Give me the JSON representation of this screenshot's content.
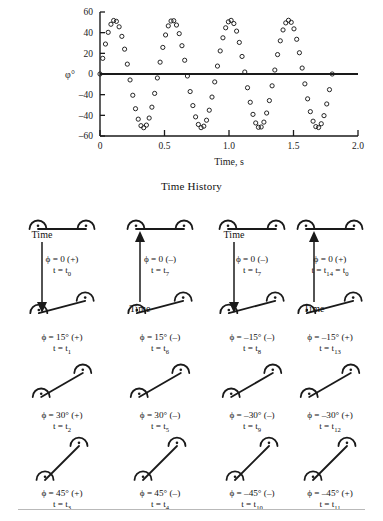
{
  "chart_data": {
    "type": "scatter",
    "title": "",
    "xlabel": "Time, s",
    "ylabel": "φ°",
    "xlim": [
      0,
      2.0
    ],
    "ylim": [
      -60,
      60
    ],
    "xticks": [
      "0",
      "0.5",
      "1.0",
      "1.5",
      "2.0"
    ],
    "xtick_values": [
      0,
      0.5,
      1.0,
      1.5,
      2.0
    ],
    "yticks": [
      "60",
      "40",
      "20",
      "0",
      "–40",
      "–40",
      "–60"
    ],
    "ytick_values": [
      60,
      40,
      20,
      0,
      -20,
      -40,
      -60
    ],
    "grid": false,
    "legend": null,
    "marker": "open-circle",
    "amplitude": 52,
    "period": 0.45,
    "phase": 0.08,
    "n_points": 86,
    "x_data_max": 1.8,
    "series": [
      {
        "name": "roll angle",
        "marker": "open-circle",
        "color": "#1a1a1a"
      }
    ]
  },
  "caption": {
    "time_history": "Time History"
  },
  "arrows": [
    {
      "name": "time-arrow-1",
      "label": "Time",
      "direction": "down",
      "label_position": "top"
    },
    {
      "name": "time-arrow-2",
      "label": "Time",
      "direction": "up",
      "label_position": "bottom"
    },
    {
      "name": "time-arrow-3",
      "label": "Time",
      "direction": "down",
      "label_position": "top"
    },
    {
      "name": "time-arrow-4",
      "label": "Time",
      "direction": "up",
      "label_position": "bottom"
    }
  ],
  "cells": [
    {
      "angle": 0,
      "phi": "ϕ = 0 (+)",
      "t": "t = t",
      "sub": "0",
      "shape": "flat",
      "mirror": false
    },
    {
      "angle": 0,
      "phi": "ϕ = 0 (–)",
      "t": "t = t",
      "sub": "7",
      "shape": "flat",
      "mirror": false
    },
    {
      "angle": 0,
      "phi": "ϕ = 0 (–)",
      "t": "t = t",
      "sub": "7",
      "shape": "flat",
      "mirror": true
    },
    {
      "angle": 0,
      "phi": "ϕ = 0 (+)",
      "t": "t = t",
      "sub": "14",
      "sub2": "0",
      "t2": " = t",
      "shape": "flat",
      "mirror": true
    },
    {
      "angle": 15,
      "phi": "ϕ = 15° (+)",
      "t": "t = t",
      "sub": "1",
      "shape": "tilt15",
      "mirror": false
    },
    {
      "angle": 15,
      "phi": "ϕ = 15° (–)",
      "t": "t = t",
      "sub": "6",
      "shape": "tilt15",
      "mirror": false
    },
    {
      "angle": -15,
      "phi": "ϕ = –15° (–)",
      "t": "t = t",
      "sub": "8",
      "shape": "tilt15",
      "mirror": true
    },
    {
      "angle": -15,
      "phi": "ϕ = –15° (+)",
      "t": "t = t",
      "sub": "13",
      "shape": "tilt15",
      "mirror": true
    },
    {
      "angle": 30,
      "phi": "ϕ = 30° (+)",
      "t": "t = t",
      "sub": "2",
      "shape": "tilt30",
      "mirror": false
    },
    {
      "angle": 30,
      "phi": "ϕ = 30° (–)",
      "t": "t = t",
      "sub": "5",
      "shape": "tilt30",
      "mirror": false
    },
    {
      "angle": -30,
      "phi": "ϕ = –30° (–)",
      "t": "t = t",
      "sub": "9",
      "shape": "tilt30",
      "mirror": true
    },
    {
      "angle": -30,
      "phi": "ϕ = –30° (+)",
      "t": "t = t",
      "sub": "12",
      "shape": "tilt30",
      "mirror": true
    },
    {
      "angle": 45,
      "phi": "ϕ = 45° (+)",
      "t": "t = t",
      "sub": "3",
      "shape": "tilt45",
      "mirror": false
    },
    {
      "angle": 45,
      "phi": "ϕ = 45° (–)",
      "t": "t = t",
      "sub": "4",
      "shape": "tilt45",
      "mirror": false
    },
    {
      "angle": -45,
      "phi": "ϕ = –45° (–)",
      "t": "t = t",
      "sub": "10",
      "shape": "tilt45",
      "mirror": true
    },
    {
      "angle": -45,
      "phi": "ϕ = –45° (+)",
      "t": "t = t",
      "sub": "11",
      "shape": "tilt45",
      "mirror": true
    }
  ]
}
